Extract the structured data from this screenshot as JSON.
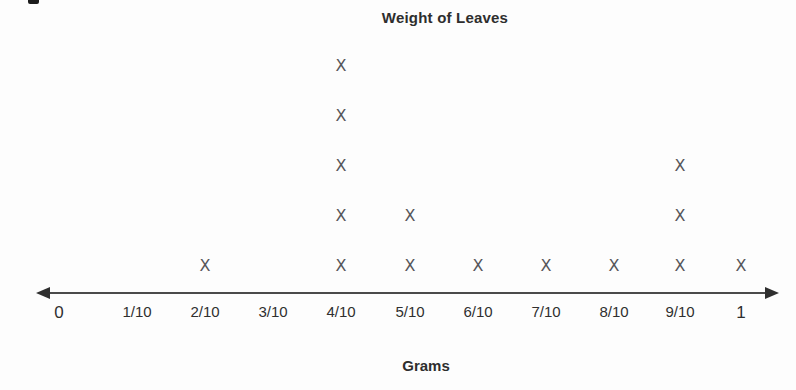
{
  "chart": {
    "title": "Weight of Leaves",
    "xlabel": "Grams",
    "colors": {
      "axis": "#4a4a4a",
      "arrow": "#2f2f2f",
      "marker": "#56565a",
      "text": "#2e2e2e",
      "background": "#fdfdfd"
    }
  },
  "chart_data": {
    "type": "scatter",
    "subtype": "dot_plot",
    "title": "Weight of Leaves",
    "xlabel": "Grams",
    "ylabel": "",
    "marker": "X",
    "grid": false,
    "axis_arrows": "both-ends",
    "categories": [
      "0",
      "1/10",
      "2/10",
      "3/10",
      "4/10",
      "5/10",
      "6/10",
      "7/10",
      "8/10",
      "9/10",
      "1"
    ],
    "counts": [
      0,
      0,
      1,
      0,
      5,
      2,
      1,
      1,
      1,
      3,
      1
    ],
    "total_marks": 15,
    "layout": {
      "x_positions_px": [
        59,
        137,
        205,
        273,
        341,
        410,
        478,
        546,
        614,
        680,
        741
      ],
      "axis_y_px": 293,
      "axis_x_start_px": 36,
      "axis_x_end_px": 779,
      "bottom_row_y_px": 266,
      "row_spacing_px": 50,
      "tick_label_offset_px": 10
    }
  }
}
